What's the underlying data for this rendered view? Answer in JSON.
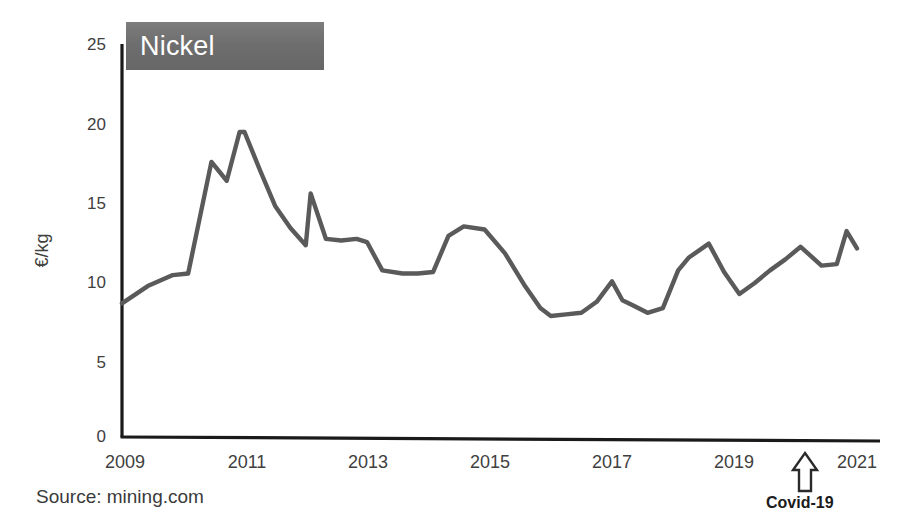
{
  "chart_data": {
    "type": "line",
    "title": "Nickel",
    "xlabel": "",
    "ylabel": "€/kg",
    "ylim": [
      0,
      25
    ],
    "xlim": [
      2009,
      2021
    ],
    "yticks": [
      0,
      5,
      10,
      15,
      20,
      25
    ],
    "ytick_labels": [
      "0",
      "5",
      "10",
      "15",
      "20",
      "25"
    ],
    "xticks": [
      2009,
      2011,
      2013,
      2015,
      2017,
      2019,
      2021
    ],
    "xtick_labels": [
      "2009",
      "2011",
      "2013",
      "2015",
      "2017",
      "2019",
      "2021"
    ],
    "grid": false,
    "legend": false,
    "series": [
      {
        "name": "Nickel price",
        "units": "€/kg",
        "x": [
          2009.0,
          2009.42,
          2009.83,
          2010.08,
          2010.46,
          2010.71,
          2010.92,
          2011.0,
          2011.25,
          2011.5,
          2011.75,
          2012.0,
          2012.08,
          2012.33,
          2012.58,
          2012.83,
          2013.0,
          2013.25,
          2013.58,
          2013.83,
          2014.08,
          2014.33,
          2014.58,
          2014.92,
          2015.25,
          2015.58,
          2015.83,
          2016.0,
          2016.25,
          2016.5,
          2016.75,
          2017.0,
          2017.17,
          2017.33,
          2017.58,
          2017.83,
          2018.08,
          2018.25,
          2018.58,
          2018.83,
          2019.08,
          2019.33,
          2019.58,
          2019.83,
          2020.08,
          2020.42,
          2020.67,
          2020.83,
          2021.0
        ],
        "y": [
          8.5,
          9.6,
          10.3,
          10.4,
          17.5,
          16.3,
          19.4,
          19.4,
          17.0,
          14.7,
          13.3,
          12.2,
          15.5,
          12.6,
          12.5,
          12.6,
          12.4,
          10.6,
          10.4,
          10.4,
          10.5,
          12.8,
          13.4,
          13.2,
          11.7,
          9.6,
          8.2,
          7.7,
          7.8,
          7.9,
          8.6,
          9.9,
          8.7,
          8.4,
          7.9,
          8.2,
          10.6,
          11.4,
          12.3,
          10.5,
          9.1,
          9.8,
          10.6,
          11.3,
          12.1,
          10.9,
          11.0,
          13.1,
          12.0
        ]
      }
    ],
    "annotations": [
      {
        "name": "covid-marker",
        "label": "Covid-19",
        "x": 2020.4,
        "icon": "up-arrow-outline-icon"
      }
    ],
    "source": "Source: mining.com",
    "colors": {
      "line": "#5a5a5a",
      "axis": "#1a1a1a",
      "title_box": "#707070",
      "title_text": "#ffffff",
      "tick_text": "#404040"
    }
  }
}
